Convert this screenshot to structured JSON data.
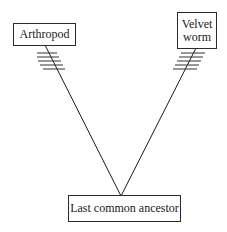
{
  "diagram": {
    "type": "phylogenetic-tree",
    "nodes": {
      "left_taxon": {
        "label": "Arthropod"
      },
      "right_taxon": {
        "label_line1": "Velvet",
        "label_line2": "worm"
      },
      "root": {
        "label": "Last common ancestor"
      }
    },
    "edges": [
      {
        "from": "root",
        "to": "left_taxon",
        "hash_marks": 5
      },
      {
        "from": "root",
        "to": "right_taxon",
        "hash_marks": 5
      }
    ],
    "colors": {
      "line": "#1a1a1a",
      "box_border": "#2a2a2a",
      "background": "#ffffff"
    }
  }
}
